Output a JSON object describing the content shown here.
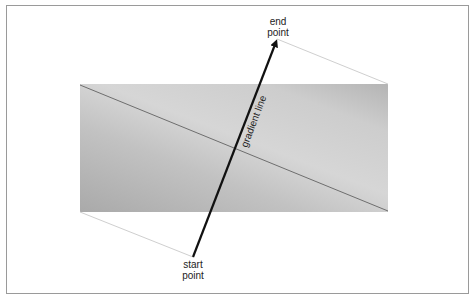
{
  "diagram": {
    "labels": {
      "end_point_line1": "end",
      "end_point_line2": "point",
      "start_point_line1": "start",
      "start_point_line2": "point",
      "gradient_line": "gradient line"
    },
    "colors": {
      "box_light": "#d4d4d4",
      "box_dark": "#a9a9a9",
      "arrow": "#111111",
      "perpendicular_line": "#6e6e6e",
      "guide_line": "#cfcfcf",
      "frame": "#9a9a9a"
    },
    "geometry": {
      "box": {
        "x": 80,
        "y": 84,
        "width": 308,
        "height": 128
      },
      "start_point": {
        "x": 193,
        "y": 257
      },
      "end_point": {
        "x": 277,
        "y": 39
      }
    }
  }
}
